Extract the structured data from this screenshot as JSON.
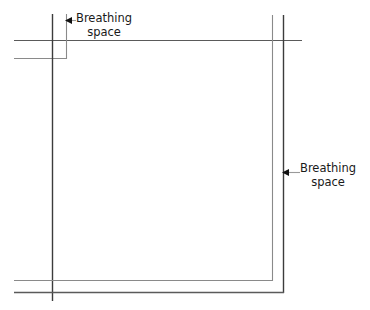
{
  "diagram": {
    "background_color": "#ffffff",
    "line_color": "#5a5a5a",
    "line_color_dark": "#3c3c3c",
    "text_color": "#1a1a1a",
    "callouts": [
      {
        "id": "top-left",
        "line1": "Breathing",
        "line2": "space",
        "arrow_direction": "left",
        "arrow_tip_x": 66,
        "arrow_tip_y": 20,
        "leader_end_x": 74
      },
      {
        "id": "right",
        "line1": "Breathing",
        "line2": "space",
        "arrow_direction": "left",
        "arrow_tip_x": 283,
        "arrow_tip_y": 172,
        "leader_end_x": 298
      }
    ],
    "rules": {
      "left_outer_vertical_x": 52,
      "left_inner_vertical_x": 66,
      "right_inner_vertical_x": 272,
      "right_outer_vertical_x": 283,
      "top_horizontal_y": 40,
      "top_inner_horizontal_y": 58,
      "bottom_inner_horizontal_y": 280,
      "bottom_outer_horizontal_y": 292,
      "left_margin_x": 14,
      "top_margin_y": 14
    }
  }
}
